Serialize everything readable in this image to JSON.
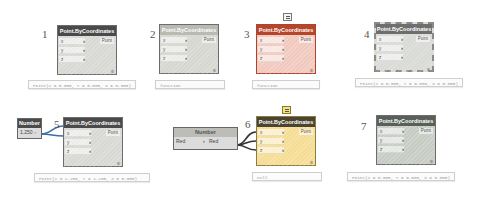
{
  "nodes": [
    {
      "id": 1,
      "label": "1",
      "title": "Point.ByCoordinates",
      "state": "default",
      "inputs": [
        "x",
        "y",
        "z"
      ],
      "output": "Point",
      "lacing": "Ⅲ",
      "preview": "Point(X = 0.000, Y = 0.000, Z = 0.000)"
    },
    {
      "id": 2,
      "label": "2",
      "title": "Point.ByCoordinates",
      "state": "inactive",
      "inputs": [
        "x",
        "y",
        "z"
      ],
      "output": "Point",
      "lacing": "Ⅲ",
      "preview": "function"
    },
    {
      "id": 3,
      "label": "3",
      "title": "Point.ByCoordinates",
      "state": "error",
      "inputs": [
        "x",
        "y",
        "z"
      ],
      "output": "Point",
      "lacing": "Ⅲ",
      "preview": "function",
      "note_icon": "comment-icon"
    },
    {
      "id": 4,
      "label": "4",
      "title": "Point.ByCoordinates",
      "state": "frozen",
      "inputs": [
        "x",
        "y",
        "z"
      ],
      "output": "Point",
      "lacing": "Ⅲ",
      "preview": "Point(X = 0.000, Y = 0.000, Z = 0.000)"
    },
    {
      "id": 5,
      "label": "5",
      "title": "Point.ByCoordinates",
      "state": "selected",
      "inputs": [
        "x",
        "y",
        "z"
      ],
      "output": "Point",
      "lacing": "Ⅲ",
      "preview": "Point(X = 1.250, Y = 1.250, Z = 0.000)"
    },
    {
      "id": 6,
      "label": "6",
      "title": "Point.ByCoordinates",
      "state": "warning",
      "inputs": [
        "x",
        "y",
        "z"
      ],
      "output": "Point",
      "lacing": "Ⅲ",
      "preview": "null",
      "note_icon": "comment-icon"
    },
    {
      "id": 7,
      "label": "7",
      "title": "Point.ByCoordinates",
      "state": "preview-off",
      "inputs": [
        "x",
        "y",
        "z"
      ],
      "output": "Point",
      "lacing": "Ⅲ",
      "preview": "Point(X = 0.000, Y = 0.000, Z = 0.000)"
    }
  ],
  "number_nodes": [
    {
      "title": "Number",
      "value": "1.250",
      "output_port": ">"
    },
    {
      "title": "Number",
      "input": "Red",
      "output": "Red",
      "output_port": ">"
    }
  ],
  "colors": {
    "error_header": "#b5462b",
    "warning_body": "#f6dd95",
    "default_header": "#4a4a4a",
    "wire_selected": "#3b6ea5",
    "wire_default": "#333333"
  }
}
